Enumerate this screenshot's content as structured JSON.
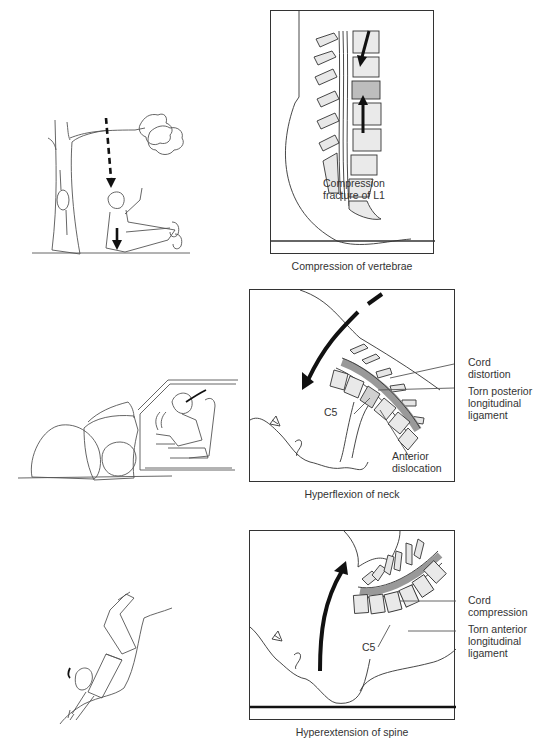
{
  "panels": [
    {
      "id": "compression",
      "scene": "fall-from-tree",
      "caption": "Compression of vertebrae",
      "labels": [
        {
          "lines": [
            "Compression",
            "fracture of L1"
          ]
        }
      ]
    },
    {
      "id": "hyperflexion",
      "scene": "car-crash-into-rocks",
      "caption": "Hyperflexion of neck",
      "labels": [
        {
          "lines": [
            "Cord",
            "distortion"
          ]
        },
        {
          "lines": [
            "Torn posterior",
            "longitudinal",
            "ligament"
          ]
        },
        {
          "lines": [
            "C5"
          ]
        },
        {
          "lines": [
            "Anterior",
            "dislocation"
          ]
        }
      ]
    },
    {
      "id": "hyperextension",
      "scene": "diving-fall",
      "caption": "Hyperextension of spine",
      "labels": [
        {
          "lines": [
            "Cord",
            "compression"
          ]
        },
        {
          "lines": [
            "Torn anterior",
            "longitudinal",
            "ligament"
          ]
        },
        {
          "lines": [
            "C5"
          ]
        }
      ]
    }
  ]
}
